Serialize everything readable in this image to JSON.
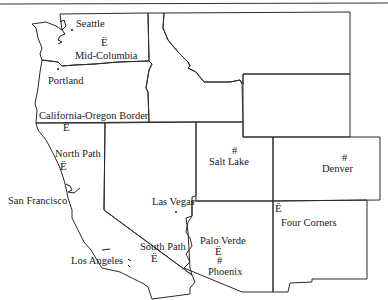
{
  "map": {
    "region": "Western United States",
    "hub_marker_glyph": "Ë",
    "city_marker_glyph": "#",
    "cities": [
      {
        "id": "seattle",
        "label": "Seattle"
      },
      {
        "id": "portland",
        "label": "Portland"
      },
      {
        "id": "san-francisco",
        "label": "San Francisco"
      },
      {
        "id": "los-angeles",
        "label": "Los Angeles"
      },
      {
        "id": "las-vegas",
        "label": "Las Vegas"
      },
      {
        "id": "salt-lake",
        "label": "Salt Lake"
      },
      {
        "id": "denver",
        "label": "Denver"
      },
      {
        "id": "phoenix",
        "label": "Phoenix"
      }
    ],
    "hubs": [
      {
        "id": "mid-columbia",
        "label": "Mid-Columbia"
      },
      {
        "id": "california-oregon-border",
        "label": "California-Oregon Border"
      },
      {
        "id": "north-path",
        "label": "North Path"
      },
      {
        "id": "south-path",
        "label": "South Path"
      },
      {
        "id": "palo-verde",
        "label": "Palo Verde"
      },
      {
        "id": "four-corners",
        "label": "Four Corners"
      }
    ],
    "states": [
      "Washington",
      "Oregon",
      "California",
      "Idaho",
      "Nevada",
      "Utah",
      "Arizona",
      "Montana",
      "Wyoming",
      "Colorado",
      "New Mexico"
    ]
  }
}
